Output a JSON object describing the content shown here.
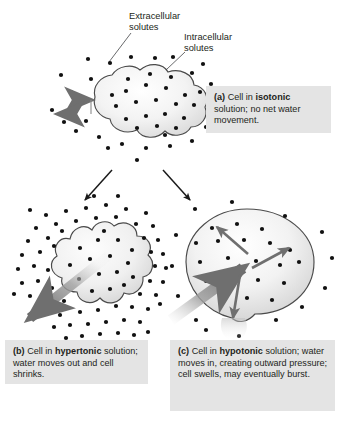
{
  "figure": {
    "title_alt": "Cell responses to isotonic, hypertonic and hypotonic solutions",
    "background_color": "#ffffff"
  },
  "annotations": [
    {
      "id": "extracellular",
      "label_line1": "Extracellular",
      "label_line2": "solutes",
      "text": "Extracellular solutes"
    },
    {
      "id": "intracellular",
      "label_line1": "Intracellular",
      "label_line2": "solutes",
      "text": "Intracellular solutes"
    }
  ],
  "panels": [
    {
      "id": "a",
      "tag": "(a)",
      "tag_text": "(a)",
      "lead": " Cell in ",
      "term": "isotonic",
      "rest": " solution; no net water movement.",
      "full_text": "(a) Cell in isotonic solution; no net water movement.",
      "cell_state": "normal",
      "water_direction": "balanced"
    },
    {
      "id": "b",
      "tag": "(b)",
      "tag_text": "(b)",
      "lead": " Cell in ",
      "term": "hypertonic",
      "rest": " solution; water moves out and cell shrinks.",
      "full_text": "(b) Cell in hypertonic solution; water moves out and cell shrinks.",
      "cell_state": "shrunken",
      "water_direction": "out"
    },
    {
      "id": "c",
      "tag": "(c)",
      "tag_text": "(c)",
      "lead": " Cell in ",
      "term": "hypotonic",
      "rest": " solution; water moves in, creating outward pressure; cell swells, may eventually burst.",
      "full_text": "(c) Cell in hypotonic solution; water moves in, creating outward pressure; cell swells, may eventually burst.",
      "cell_state": "swollen",
      "water_direction": "in"
    }
  ],
  "colors": {
    "caption_background": "#e4e4e4",
    "text": "#231f20",
    "solute_dot": "#111111",
    "membrane_outline": "#4a4a4a",
    "branch_arrow": "#1a1a1a",
    "water_arrow": "#8c8c8c",
    "pressure_arrow": "#777777",
    "leader_line": "#58595b"
  },
  "legend_counts": {
    "isotonic_inside_dots": 22,
    "isotonic_outside_dots": 24,
    "hypertonic_inside_dots": 16,
    "hypertonic_outside_dots": 62,
    "hypotonic_inside_dots": 20,
    "hypotonic_outside_dots": 14
  }
}
